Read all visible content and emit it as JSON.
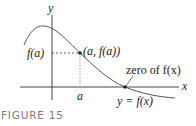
{
  "figure": {
    "caption": "FIGURE 15",
    "axes": {
      "x_label": "x",
      "y_label": "y"
    },
    "labels": {
      "f_of_a": "f(a)",
      "point": "(a, f(a))",
      "a_tick": "a",
      "zero": "zero of f(x)",
      "curve": "y = f(x)"
    },
    "colors": {
      "curve": "#555555",
      "axes": "#444444",
      "text": "#222222",
      "caption": "#7a7a7a"
    }
  }
}
